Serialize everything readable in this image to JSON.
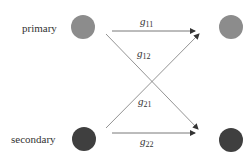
{
  "diagram": {
    "nodes": [
      {
        "id": "tx1",
        "label": "primary",
        "color": "#8c8c8c"
      },
      {
        "id": "tx2",
        "label": "secondary",
        "color": "#3f3f3f"
      },
      {
        "id": "rx1",
        "label": "",
        "color": "#8c8c8c"
      },
      {
        "id": "rx2",
        "label": "",
        "color": "#3f3f3f"
      }
    ],
    "edges": [
      {
        "from": "tx1",
        "to": "rx1",
        "label_base": "g",
        "label_sub": "11"
      },
      {
        "from": "tx1",
        "to": "rx2",
        "label_base": "g",
        "label_sub": "12"
      },
      {
        "from": "tx2",
        "to": "rx1",
        "label_base": "g",
        "label_sub": "21"
      },
      {
        "from": "tx2",
        "to": "rx2",
        "label_base": "g",
        "label_sub": "22"
      }
    ],
    "edge_color": "#555555"
  }
}
